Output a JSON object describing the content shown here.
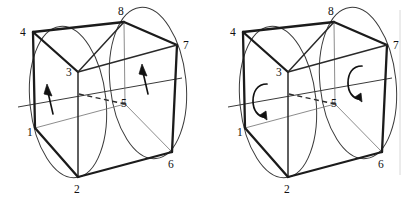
{
  "figure": {
    "background_color": "#ffffff",
    "ink_color": "#1b1b1b",
    "panel_count": 2
  },
  "panels": [
    {
      "id": "left",
      "name": "left-figure",
      "arrow_style": "straight",
      "arrow_direction": "up-left",
      "arrow_count": 2,
      "vertices": [
        {
          "id": "1",
          "label": "1",
          "x": 35,
          "y": 128,
          "lx": 30,
          "ly": 134
        },
        {
          "id": "2",
          "label": "2",
          "x": 78,
          "y": 177,
          "lx": 75,
          "ly": 192
        },
        {
          "id": "3",
          "label": "3",
          "x": 78,
          "y": 72,
          "lx": 68,
          "ly": 72
        },
        {
          "id": "4",
          "label": "4",
          "x": 33,
          "y": 32,
          "lx": 22,
          "ly": 33
        },
        {
          "id": "5",
          "label": "5",
          "x": 125,
          "y": 104,
          "lx": 121,
          "ly": 103
        },
        {
          "id": "6",
          "label": "6",
          "x": 172,
          "y": 152,
          "lx": 170,
          "ly": 166
        },
        {
          "id": "7",
          "label": "7",
          "x": 177,
          "y": 45,
          "lx": 183,
          "ly": 45
        },
        {
          "id": "8",
          "label": "8",
          "x": 124,
          "y": 22,
          "lx": 119,
          "ly": 13
        }
      ],
      "edges_solid": [
        [
          "4",
          "8"
        ],
        [
          "8",
          "7"
        ],
        [
          "4",
          "3"
        ],
        [
          "3",
          "2"
        ],
        [
          "2",
          "6"
        ],
        [
          "6",
          "7"
        ],
        [
          "4",
          "1"
        ],
        [
          "1",
          "2"
        ],
        [
          "3",
          "8"
        ],
        [
          "7",
          "6"
        ]
      ],
      "edges_hidden": [
        [
          "3",
          "5"
        ]
      ],
      "edges_thin": [
        [
          "1",
          "5"
        ],
        [
          "5",
          "6"
        ],
        [
          "5",
          "8"
        ]
      ],
      "circles": [
        {
          "name": "left-face-circle",
          "cx": 68,
          "cy": 102,
          "rx": 38,
          "ry": 76,
          "rotate": -6
        },
        {
          "name": "right-face-circle",
          "cx": 148,
          "cy": 83,
          "rx": 38,
          "ry": 76,
          "rotate": -6
        }
      ],
      "axis": {
        "x1": 18,
        "y1": 107,
        "x2": 182,
        "y2": 78
      },
      "arrows": [
        {
          "name": "rotation-arrow-left",
          "x": 52,
          "y": 112,
          "tip_x": 45,
          "tip_y": 84
        },
        {
          "name": "rotation-arrow-right",
          "x": 147,
          "y": 92,
          "tip_x": 140,
          "tip_y": 64
        }
      ]
    },
    {
      "id": "right",
      "name": "right-figure",
      "arrow_style": "curved",
      "arrow_direction": "clockwise-hook",
      "arrow_count": 2,
      "vertices": [
        {
          "id": "1",
          "label": "1",
          "x": 35,
          "y": 128,
          "lx": 30,
          "ly": 134
        },
        {
          "id": "2",
          "label": "2",
          "x": 78,
          "y": 177,
          "lx": 75,
          "ly": 192
        },
        {
          "id": "3",
          "label": "3",
          "x": 78,
          "y": 72,
          "lx": 68,
          "ly": 72
        },
        {
          "id": "4",
          "label": "4",
          "x": 33,
          "y": 32,
          "lx": 22,
          "ly": 33
        },
        {
          "id": "5",
          "label": "5",
          "x": 125,
          "y": 104,
          "lx": 121,
          "ly": 103
        },
        {
          "id": "6",
          "label": "6",
          "x": 172,
          "y": 152,
          "lx": 170,
          "ly": 166
        },
        {
          "id": "7",
          "label": "7",
          "x": 177,
          "y": 45,
          "lx": 183,
          "ly": 45
        },
        {
          "id": "8",
          "label": "8",
          "x": 124,
          "y": 22,
          "lx": 119,
          "ly": 13
        }
      ],
      "edges_solid": [
        [
          "4",
          "8"
        ],
        [
          "8",
          "7"
        ],
        [
          "4",
          "3"
        ],
        [
          "3",
          "2"
        ],
        [
          "2",
          "6"
        ],
        [
          "6",
          "7"
        ],
        [
          "4",
          "1"
        ],
        [
          "1",
          "2"
        ],
        [
          "3",
          "8"
        ],
        [
          "7",
          "6"
        ]
      ],
      "edges_hidden": [
        [
          "3",
          "5"
        ]
      ],
      "edges_thin": [
        [
          "1",
          "5"
        ],
        [
          "5",
          "6"
        ],
        [
          "5",
          "8"
        ]
      ],
      "circles": [
        {
          "name": "left-face-circle",
          "cx": 68,
          "cy": 102,
          "rx": 38,
          "ry": 76,
          "rotate": -6
        },
        {
          "name": "right-face-circle",
          "cx": 148,
          "cy": 83,
          "rx": 38,
          "ry": 76,
          "rotate": -6
        }
      ],
      "axis": {
        "x1": 18,
        "y1": 107,
        "x2": 182,
        "y2": 78
      },
      "arrows": [
        {
          "name": "rotation-arrow-left",
          "cx": 52,
          "cy": 100
        },
        {
          "name": "rotation-arrow-right",
          "cx": 147,
          "cy": 82
        }
      ]
    }
  ],
  "divider": {
    "name": "panel-divider",
    "x": 400,
    "y1": 10,
    "y2": 175,
    "color": "#d8d8d8"
  }
}
